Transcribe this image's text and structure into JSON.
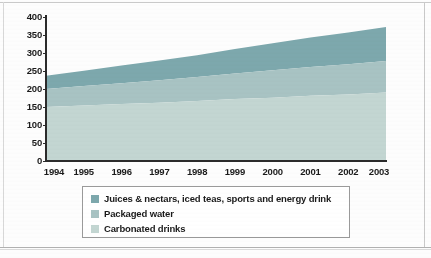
{
  "chart_data": {
    "type": "area",
    "stacked": true,
    "title": "",
    "subtitle": "",
    "xlabel": "",
    "ylabel": "",
    "x": [
      1994,
      1995,
      1996,
      1997,
      1998,
      1999,
      2000,
      2001,
      2002,
      2003
    ],
    "categories": [
      "1994",
      "1995",
      "1996",
      "1997",
      "1998",
      "1999",
      "2000",
      "2001",
      "2002",
      "2003"
    ],
    "xlim": [
      1994,
      2003
    ],
    "ylim": [
      0,
      400
    ],
    "yticks": [
      0,
      50,
      100,
      150,
      200,
      250,
      300,
      350,
      400
    ],
    "ytick_labels": [
      "0",
      "50",
      "100",
      "150",
      "200",
      "250",
      "300",
      "350",
      "400"
    ],
    "grid": false,
    "legend_position": "bottom",
    "series": [
      {
        "name": "Carbonated drinks",
        "color": "#c3d6d2",
        "values": [
          150,
          154,
          158,
          162,
          167,
          172,
          176,
          181,
          185,
          190
        ]
      },
      {
        "name": "Packaged water",
        "color": "#a8c3c3",
        "values": [
          50,
          54,
          58,
          62,
          66,
          71,
          76,
          80,
          84,
          88
        ]
      },
      {
        "name": "Juices & nectars, iced teas, sports and energy drink",
        "color": "#7da8ad",
        "values": [
          37,
          43,
          49,
          55,
          61,
          68,
          75,
          82,
          88,
          94
        ]
      }
    ],
    "cumulative": [
      {
        "name": "Carbonated drinks",
        "values": [
          150,
          154,
          158,
          162,
          167,
          172,
          176,
          181,
          185,
          190
        ]
      },
      {
        "name": "Packaged water",
        "values": [
          200,
          208,
          216,
          224,
          233,
          243,
          252,
          261,
          269,
          278
        ]
      },
      {
        "name": "Juices & nectars, iced teas, sports and energy drink",
        "values": [
          237,
          251,
          265,
          279,
          294,
          311,
          327,
          343,
          357,
          372
        ]
      }
    ]
  },
  "legend": {
    "items": [
      {
        "label": "Juices & nectars, iced teas, sports and energy drink",
        "color": "#7da8ad"
      },
      {
        "label": "Packaged water",
        "color": "#a8c3c3"
      },
      {
        "label": "Carbonated drinks",
        "color": "#c3d6d2"
      }
    ]
  },
  "colors": {
    "series_top": "#7da8ad",
    "series_mid": "#a8c3c3",
    "series_bottom": "#c3d6d2",
    "axis": "#2b2b2b",
    "text": "#1b1b1b",
    "legend_border": "#9a9a9a",
    "page_background": "#fdfdfd"
  }
}
